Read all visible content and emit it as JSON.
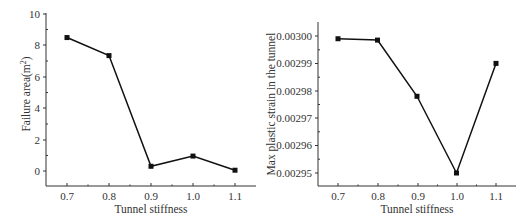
{
  "chart_data": [
    {
      "type": "line",
      "title": "",
      "xlabel": "Tunnel stiffness",
      "ylabel": "Failure area(m²)",
      "ylabel_main": "Failure area(m",
      "ylabel_sup": "2",
      "ylabel_end": ")",
      "x": [
        0.7,
        0.8,
        0.9,
        1.0,
        1.1
      ],
      "x_tick_labels": [
        "0.7",
        "0.8",
        "0.9",
        "1.0",
        "1.1"
      ],
      "y_tick_labels": [
        "0",
        "2",
        "4",
        "6",
        "8",
        "10"
      ],
      "values": [
        8.5,
        7.35,
        0.3,
        0.95,
        0.05
      ],
      "ylim": [
        -1,
        10
      ],
      "xlim": [
        0.65,
        1.15
      ],
      "grid": false,
      "marker": "square"
    },
    {
      "type": "line",
      "title": "",
      "xlabel": "Tunnel stiffness",
      "ylabel": "Max plastic strain in the tunnel",
      "x": [
        0.7,
        0.8,
        0.9,
        1.0,
        1.1
      ],
      "x_tick_labels": [
        "0.7",
        "0.8",
        "0.9",
        "1.0",
        "1.1"
      ],
      "y_tick_labels": [
        "0.00295",
        "0.00296",
        "0.00297",
        "0.00298",
        "0.00299",
        "0.00300"
      ],
      "values": [
        0.002999,
        0.0029985,
        0.002978,
        0.00295,
        0.00299
      ],
      "ylim": [
        0.002945,
        0.003005
      ],
      "xlim": [
        0.65,
        1.15
      ],
      "grid": false,
      "marker": "square"
    }
  ]
}
